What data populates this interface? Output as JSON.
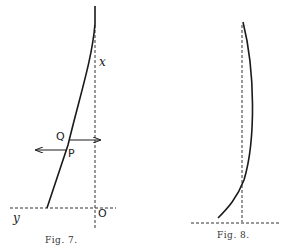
{
  "figures": [
    {
      "caption": "Fig. 7.",
      "labels": {
        "x_axis": "x",
        "y_axis": "y",
        "origin": "O",
        "point_q": "Q",
        "point_p": "P"
      }
    },
    {
      "caption": "Fig. 8."
    }
  ],
  "colors": {
    "ink": "#1a1a1a",
    "background": "#ffffff"
  }
}
